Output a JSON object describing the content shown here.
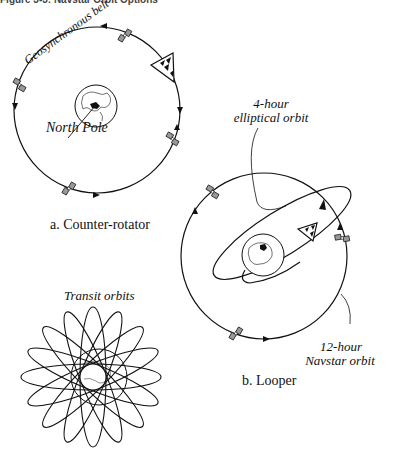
{
  "header": {
    "title": "Figure 3-3: Navstar Orbit Options"
  },
  "panel_a": {
    "caption": "a. Counter-rotator",
    "belt_label": "Geosynchronous belt",
    "pole_label": "North Pole"
  },
  "panel_b": {
    "caption": "b. Looper",
    "ellipse_label_line1": "4-hour",
    "ellipse_label_line2": "elliptical orbit",
    "navstar_label_line1": "12-hour",
    "navstar_label_line2": "Navstar orbit"
  },
  "panel_c": {
    "title": "Transit orbits"
  },
  "colors": {
    "ink": "#111111",
    "satellite_panel": "#888888",
    "background": "#ffffff"
  }
}
